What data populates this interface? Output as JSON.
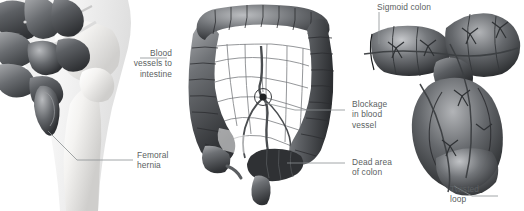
{
  "figure": {
    "style": "grayscale medical illustration",
    "accent_color": "#5b5f62",
    "leader_color": "#8c9092",
    "background": "#ffffff"
  },
  "panels": [
    {
      "id": "femoral-hernia",
      "caption": "Femoral hernia with herniated small intestine through the femoral canal",
      "labels": [
        {
          "id": "blood-vessels",
          "text": "Blood\nvessels to\nintestine",
          "align": "right"
        },
        {
          "id": "femoral-hernia",
          "text": "Femoral\nhernia",
          "align": "left"
        }
      ]
    },
    {
      "id": "colon-ischemia",
      "caption": "Large intestine showing mesenteric blood supply with an occluded vessel",
      "labels": [
        {
          "id": "blockage",
          "text": "Blockage\nin blood\nvessel",
          "align": "left"
        },
        {
          "id": "dead-area",
          "text": "Dead area\nof colon",
          "align": "left"
        }
      ]
    },
    {
      "id": "sigmoid-volvulus",
      "caption": "Sigmoid volvulus: twisted loop of sigmoid colon",
      "labels": [
        {
          "id": "sigmoid-colon",
          "text": "Sigmoid colon",
          "align": "left"
        },
        {
          "id": "twisted-loop",
          "text": "Twisted\nloop",
          "align": "left"
        }
      ]
    }
  ],
  "labels": {
    "blood_vessels_to_intestine": "Blood\nvessels to\nintestine",
    "femoral_hernia": "Femoral\nhernia",
    "blockage_in_blood_vessel": "Blockage\nin blood\nvessel",
    "dead_area_of_colon": "Dead area\nof colon",
    "sigmoid_colon": "Sigmoid colon",
    "twisted_loop": "Twisted\nloop"
  }
}
